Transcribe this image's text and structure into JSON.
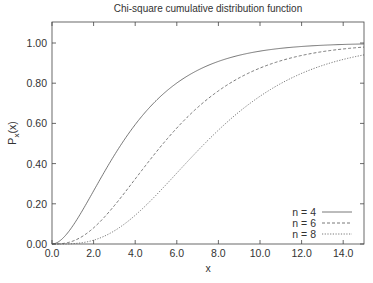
{
  "chart_data": {
    "type": "line",
    "title": "Chi-square cumulative distribution function",
    "xlabel": "x",
    "ylabel": "P_x(x)",
    "xlim": [
      0,
      15
    ],
    "ylim": [
      0,
      1
    ],
    "xticks": [
      "0.0",
      "2.0",
      "4.0",
      "6.0",
      "8.0",
      "10.0",
      "12.0",
      "14.0"
    ],
    "yticks": [
      "0.00",
      "0.20",
      "0.40",
      "0.60",
      "0.80",
      "1.00"
    ],
    "grid": false,
    "legend_position": "lower right",
    "series": [
      {
        "name": "n = 4",
        "k": 4,
        "style": "solid",
        "x": [
          0,
          2,
          4,
          6,
          8,
          10,
          12,
          14,
          15
        ],
        "values": [
          0,
          0.264,
          0.594,
          0.801,
          0.908,
          0.96,
          0.983,
          0.993,
          0.995
        ]
      },
      {
        "name": "n = 6",
        "k": 6,
        "style": "dashed",
        "x": [
          0,
          2,
          4,
          6,
          8,
          10,
          12,
          14,
          15
        ],
        "values": [
          0,
          0.08,
          0.323,
          0.577,
          0.762,
          0.875,
          0.938,
          0.97,
          0.98
        ]
      },
      {
        "name": "n = 8",
        "k": 8,
        "style": "dotted",
        "x": [
          0,
          2,
          4,
          6,
          8,
          10,
          12,
          14,
          15
        ],
        "values": [
          0,
          0.019,
          0.143,
          0.353,
          0.567,
          0.735,
          0.849,
          0.918,
          0.941
        ]
      }
    ]
  }
}
